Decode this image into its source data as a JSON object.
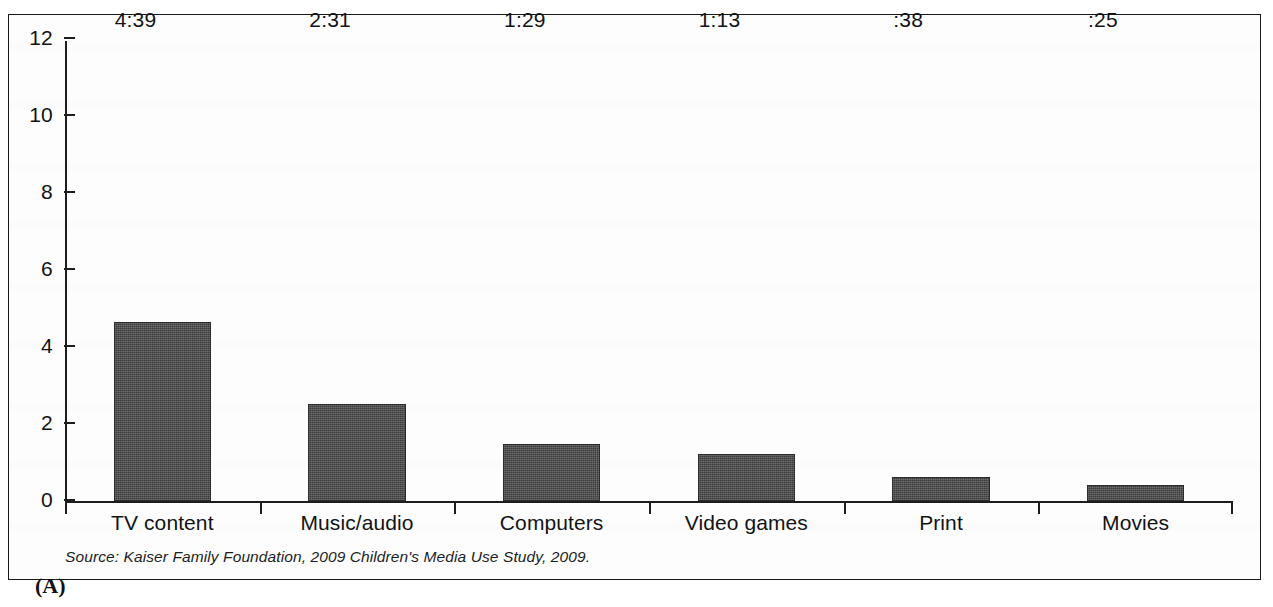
{
  "figure": {
    "panel_label": "(A)",
    "source_note": "Source: Kaiser Family Foundation, 2009 Children's Media Use Study, 2009."
  },
  "chart_data": {
    "type": "bar",
    "title": "",
    "subtitle": "",
    "xlabel": "",
    "ylabel": "",
    "ylim": [
      0,
      12
    ],
    "ytick_values": [
      0,
      2,
      4,
      6,
      8,
      10,
      12
    ],
    "ytick_labels": [
      "0",
      "2",
      "4",
      "6",
      "8",
      "10",
      "12"
    ],
    "grid": false,
    "legend": false,
    "legend_position": "none",
    "categories": [
      "TV content",
      "Music/audio",
      "Computers",
      "Video games",
      "Print",
      "Movies"
    ],
    "values": [
      4.65,
      2.52,
      1.48,
      1.22,
      0.63,
      0.42
    ],
    "data_labels": [
      "4:39",
      "2:31",
      "1:29",
      "1:13",
      ":38",
      ":25"
    ],
    "bar_color": "#4a4a4a",
    "axis_color": "#1b1d1f",
    "background_color": "#fdfdfd"
  }
}
